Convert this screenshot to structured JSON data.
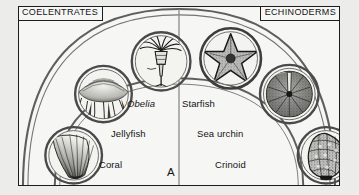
{
  "figure": {
    "panel_letter": "A",
    "headers": {
      "left": "COELENTRATES",
      "right": "ECHINODERMS"
    },
    "colors": {
      "background": "#f6f6f4",
      "page_margin": "#ececeb",
      "ink": "#1c1c1c",
      "arc_line": "#5a5a5a",
      "circle_ring": "#4a4a4a"
    },
    "labels": [
      {
        "id": "obelia",
        "text": "Obelia",
        "style": "italic",
        "group": "coelenterates"
      },
      {
        "id": "starfish",
        "text": "Starfish",
        "style": "regular",
        "group": "echinoderms"
      },
      {
        "id": "jellyfish",
        "text": "Jellyfish",
        "style": "regular",
        "group": "coelenterates"
      },
      {
        "id": "sea-urchin",
        "text": "Sea urchin",
        "style": "regular",
        "group": "echinoderms"
      },
      {
        "id": "coral",
        "text": "Coral",
        "style": "regular",
        "group": "coelenterates"
      },
      {
        "id": "crinoid",
        "text": "Crinoid",
        "style": "regular",
        "group": "echinoderms"
      }
    ],
    "organisms": [
      {
        "id": "obelia",
        "name": "Obelia hydroid",
        "icon": "hydroid-icon",
        "cx": 143,
        "cy": 55,
        "r": 30
      },
      {
        "id": "starfish",
        "name": "Starfish",
        "icon": "starfish-icon",
        "cx": 213,
        "cy": 52,
        "r": 31
      },
      {
        "id": "jellyfish",
        "name": "Jellyfish",
        "icon": "jellyfish-icon",
        "cx": 85,
        "cy": 88,
        "r": 29
      },
      {
        "id": "sea-urchin",
        "name": "Sea urchin test",
        "icon": "urchin-icon",
        "cx": 272,
        "cy": 88,
        "r": 30
      },
      {
        "id": "coral",
        "name": "Fan coral",
        "icon": "coral-icon",
        "cx": 55,
        "cy": 150,
        "r": 29
      },
      {
        "id": "crinoid",
        "name": "Crinoid calyx",
        "icon": "crinoid-icon",
        "cx": 309,
        "cy": 150,
        "r": 29
      }
    ]
  }
}
